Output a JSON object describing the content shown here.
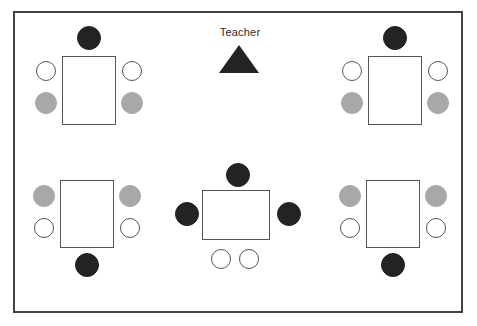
{
  "diagram": {
    "type": "classroom-layout",
    "canvas": {
      "width": 477,
      "height": 326
    },
    "room": {
      "label": "classroom-boundary",
      "x": 13,
      "y": 11,
      "width": 450,
      "height": 302,
      "border_color": "#434343",
      "fill_color": "#ffffff"
    },
    "colors": {
      "seat_black": "#232323",
      "seat_gray": "#a8a8a8",
      "seat_white_fill": "#ffffff",
      "seat_white_stroke": "#555555",
      "table_stroke": "#555555",
      "room_stroke": "#434343",
      "background": "#ffffff",
      "text": "#2a2a2a"
    },
    "teacher": {
      "label": "Teacher",
      "marker_shape": "triangle",
      "marker_color": "#232323",
      "label_x": 240,
      "label_y": 33,
      "marker_x": 239,
      "marker_y": 59
    },
    "groups": [
      {
        "id": "group-top-left",
        "name": "Top Left Table Group",
        "table": {
          "x": 62,
          "y": 56,
          "width": 54,
          "height": 69,
          "orientation": "portrait"
        },
        "seats": [
          {
            "id": "tl-seat-top",
            "position": "top-center",
            "color": "black",
            "cx": 89,
            "cy": 38,
            "r": 12
          },
          {
            "id": "tl-seat-left-upper",
            "position": "left-upper",
            "color": "white",
            "cx": 46,
            "cy": 71,
            "r": 10
          },
          {
            "id": "tl-seat-right-upper",
            "position": "right-upper",
            "color": "white",
            "cx": 132,
            "cy": 71,
            "r": 10
          },
          {
            "id": "tl-seat-left-lower",
            "position": "left-lower",
            "color": "gray",
            "cx": 46,
            "cy": 103,
            "r": 11
          },
          {
            "id": "tl-seat-right-lower",
            "position": "right-lower",
            "color": "gray",
            "cx": 132,
            "cy": 103,
            "r": 11
          }
        ]
      },
      {
        "id": "group-top-right",
        "name": "Top Right Table Group",
        "table": {
          "x": 368,
          "y": 56,
          "width": 54,
          "height": 69,
          "orientation": "portrait"
        },
        "seats": [
          {
            "id": "tr-seat-top",
            "position": "top-center",
            "color": "black",
            "cx": 395,
            "cy": 38,
            "r": 12
          },
          {
            "id": "tr-seat-left-upper",
            "position": "left-upper",
            "color": "white",
            "cx": 352,
            "cy": 71,
            "r": 10
          },
          {
            "id": "tr-seat-right-upper",
            "position": "right-upper",
            "color": "white",
            "cx": 438,
            "cy": 71,
            "r": 10
          },
          {
            "id": "tr-seat-left-lower",
            "position": "left-lower",
            "color": "gray",
            "cx": 352,
            "cy": 103,
            "r": 11
          },
          {
            "id": "tr-seat-right-lower",
            "position": "right-lower",
            "color": "gray",
            "cx": 438,
            "cy": 103,
            "r": 11
          }
        ]
      },
      {
        "id": "group-bottom-left",
        "name": "Bottom Left Table Group",
        "table": {
          "x": 60,
          "y": 180,
          "width": 54,
          "height": 68,
          "orientation": "portrait"
        },
        "seats": [
          {
            "id": "bl-seat-left-upper",
            "position": "left-upper",
            "color": "gray",
            "cx": 44,
            "cy": 196,
            "r": 11
          },
          {
            "id": "bl-seat-right-upper",
            "position": "right-upper",
            "color": "gray",
            "cx": 130,
            "cy": 196,
            "r": 11
          },
          {
            "id": "bl-seat-left-lower",
            "position": "left-lower",
            "color": "white",
            "cx": 44,
            "cy": 228,
            "r": 10
          },
          {
            "id": "bl-seat-right-lower",
            "position": "right-lower",
            "color": "white",
            "cx": 130,
            "cy": 228,
            "r": 10
          },
          {
            "id": "bl-seat-bottom",
            "position": "bottom-center",
            "color": "black",
            "cx": 87,
            "cy": 265,
            "r": 12
          }
        ]
      },
      {
        "id": "group-bottom-right",
        "name": "Bottom Right Table Group",
        "table": {
          "x": 366,
          "y": 180,
          "width": 54,
          "height": 68,
          "orientation": "portrait"
        },
        "seats": [
          {
            "id": "br-seat-left-upper",
            "position": "left-upper",
            "color": "gray",
            "cx": 350,
            "cy": 196,
            "r": 11
          },
          {
            "id": "br-seat-right-upper",
            "position": "right-upper",
            "color": "gray",
            "cx": 436,
            "cy": 196,
            "r": 11
          },
          {
            "id": "br-seat-left-lower",
            "position": "left-lower",
            "color": "white",
            "cx": 350,
            "cy": 228,
            "r": 10
          },
          {
            "id": "br-seat-right-lower",
            "position": "right-lower",
            "color": "white",
            "cx": 436,
            "cy": 228,
            "r": 10
          },
          {
            "id": "br-seat-bottom",
            "position": "bottom-center",
            "color": "black",
            "cx": 393,
            "cy": 265,
            "r": 12
          }
        ]
      },
      {
        "id": "group-center",
        "name": "Center Table Group",
        "table": {
          "x": 202,
          "y": 190,
          "width": 68,
          "height": 50,
          "orientation": "landscape"
        },
        "seats": [
          {
            "id": "c-seat-top",
            "position": "top-center",
            "color": "black",
            "cx": 238,
            "cy": 175,
            "r": 12
          },
          {
            "id": "c-seat-left",
            "position": "left-center",
            "color": "black",
            "cx": 187,
            "cy": 214,
            "r": 12
          },
          {
            "id": "c-seat-right",
            "position": "right-center",
            "color": "black",
            "cx": 289,
            "cy": 214,
            "r": 12
          },
          {
            "id": "c-seat-bottom-left",
            "position": "bottom-left",
            "color": "white",
            "cx": 221,
            "cy": 259,
            "r": 10
          },
          {
            "id": "c-seat-bottom-right",
            "position": "bottom-right",
            "color": "white",
            "cx": 249,
            "cy": 259,
            "r": 10
          }
        ]
      }
    ],
    "legend_summary": {
      "total_tables": 5,
      "total_seats": 25,
      "black_seats": 7,
      "gray_seats": 8,
      "white_seats": 10
    }
  }
}
